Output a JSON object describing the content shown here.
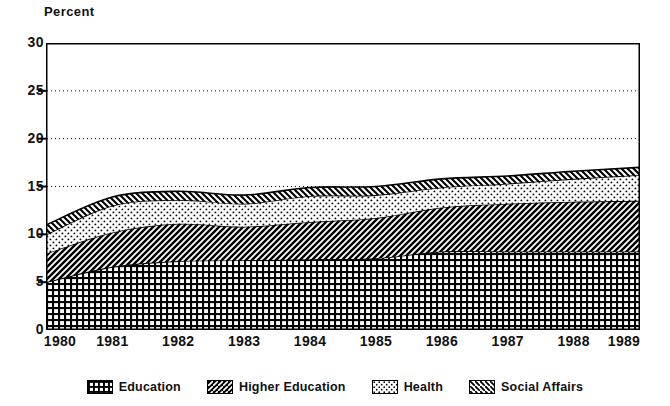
{
  "axis_title": "Percent",
  "y_ticks": [
    "30",
    "25",
    "20",
    "15",
    "10",
    "5",
    "0"
  ],
  "x_ticks": [
    "1980",
    "1981",
    "1982",
    "1983",
    "1984",
    "1985",
    "1986",
    "1987",
    "1988",
    "1989"
  ],
  "legend": {
    "items": [
      {
        "label": "Education",
        "pattern": "grid-crosshatch",
        "swatch_name": "legend-swatch-education"
      },
      {
        "label": "Higher Education",
        "pattern": "forward-diagonal-dense",
        "swatch_name": "legend-swatch-higher-education"
      },
      {
        "label": "Health",
        "pattern": "stipple-dots",
        "swatch_name": "legend-swatch-health"
      },
      {
        "label": "Social Affairs",
        "pattern": "backward-diagonal",
        "swatch_name": "legend-swatch-social-affairs"
      }
    ]
  },
  "colors": {
    "ink": "#000000",
    "background": "#ffffff",
    "education_fill": "#ffffff",
    "higher_education_fill": "#ffffff",
    "health_fill": "#ffffff",
    "social_affairs_fill": "#ffffff",
    "gridline": "#000000"
  },
  "chart_data": {
    "type": "area",
    "stacked": true,
    "title": "",
    "subtitle": "",
    "xlabel": "",
    "ylabel": "Percent",
    "xlim": [
      1980,
      1989
    ],
    "ylim": [
      0,
      30
    ],
    "y_ticks": [
      0,
      5,
      10,
      15,
      20,
      25,
      30
    ],
    "grid": "horizontal-dotted at 15, 20, 25",
    "legend_position": "bottom",
    "x": [
      1980,
      1981,
      1982,
      1983,
      1984,
      1985,
      1986,
      1987,
      1988,
      1989
    ],
    "series": [
      {
        "name": "Education",
        "pattern": "grid-crosshatch",
        "values": [
          5.0,
          6.6,
          7.2,
          7.3,
          7.4,
          7.5,
          8.2,
          8.2,
          8.2,
          8.2
        ]
      },
      {
        "name": "Higher Education",
        "pattern": "forward-diagonal-dense",
        "values": [
          3.0,
          3.6,
          3.9,
          3.5,
          3.9,
          4.2,
          4.6,
          5.0,
          5.2,
          5.3
        ]
      },
      {
        "name": "Health",
        "pattern": "stipple-dots",
        "values": [
          2.0,
          2.8,
          2.5,
          2.4,
          2.7,
          2.4,
          2.1,
          2.1,
          2.4,
          2.7
        ]
      },
      {
        "name": "Social Affairs",
        "pattern": "backward-diagonal",
        "values": [
          1.0,
          0.9,
          0.9,
          0.9,
          0.9,
          0.9,
          0.9,
          0.8,
          0.8,
          0.8
        ]
      }
    ],
    "cumulative_tops": {
      "Education": [
        5.0,
        6.6,
        7.2,
        7.3,
        7.4,
        7.5,
        8.2,
        8.2,
        8.2,
        8.2
      ],
      "Higher Education": [
        8.0,
        10.2,
        11.1,
        10.8,
        11.3,
        11.7,
        12.8,
        13.2,
        13.4,
        13.5
      ],
      "Health": [
        10.0,
        13.0,
        13.6,
        13.2,
        14.0,
        14.1,
        14.9,
        15.3,
        15.8,
        16.2
      ],
      "Social Affairs": [
        11.0,
        13.9,
        14.5,
        14.1,
        14.9,
        15.0,
        15.8,
        16.1,
        16.6,
        17.0
      ]
    }
  }
}
